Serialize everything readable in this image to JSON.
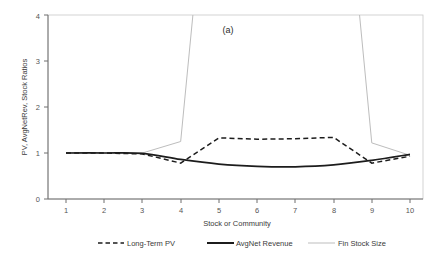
{
  "figure": {
    "panel_label": "(a)",
    "background": "#ffffff"
  },
  "axes": {
    "y_title": "PV, AvgNetRev, Stock Ratios",
    "x_title": "Stock or Community",
    "y_ticks": [
      "0",
      "1",
      "2",
      "3",
      "4"
    ],
    "x_ticks": [
      "1",
      "2",
      "3",
      "4",
      "5",
      "6",
      "7",
      "8",
      "9",
      "10"
    ]
  },
  "legend": {
    "items": [
      {
        "label": "Long-Term PV",
        "style": "dashed",
        "color": "#1c1c1c"
      },
      {
        "label": "AvgNet Revenue",
        "style": "solid-thick",
        "color": "#1c1c1c"
      },
      {
        "label": "Fin Stock Size",
        "style": "solid-thin",
        "color": "#bdbdbd"
      }
    ]
  },
  "chart_data": {
    "type": "line",
    "title": "(a)",
    "subtitle": "",
    "xlabel": "Stock or Community",
    "ylabel": "PV, AvgNetRev, Stock Ratios",
    "xlim": [
      1,
      10
    ],
    "ylim": [
      0,
      4
    ],
    "xticks": [
      1,
      2,
      3,
      4,
      5,
      6,
      7,
      8,
      9,
      10
    ],
    "yticks": [
      0,
      1,
      2,
      3,
      4
    ],
    "grid": false,
    "legend_position": "below-plot",
    "annotations": [
      {
        "text": "(a)",
        "x": 5.6,
        "y": 3.75
      },
      {
        "text": "Fin Stock Size exceeds the plotted y-range between x=4.3 and x=8.7",
        "x": 6.5,
        "y": 4.0
      }
    ],
    "x": [
      1,
      2,
      3,
      4,
      5,
      6,
      7,
      8,
      9,
      10
    ],
    "series": [
      {
        "name": "Long-Term PV",
        "color": "#1c1c1c",
        "style": "dashed",
        "values": [
          1.0,
          1.0,
          0.98,
          0.78,
          1.33,
          1.3,
          1.31,
          1.34,
          0.78,
          0.93
        ]
      },
      {
        "name": "AvgNet Revenue",
        "color": "#1c1c1c",
        "style": "solid",
        "values": [
          1.0,
          1.0,
          0.99,
          0.86,
          0.76,
          0.71,
          0.7,
          0.74,
          0.84,
          0.97
        ]
      },
      {
        "name": "Fin Stock Size",
        "color": "#bdbdbd",
        "style": "solid-thin",
        "values": [
          1.0,
          1.0,
          1.0,
          1.25,
          4.0,
          4.0,
          4.0,
          4.0,
          1.22,
          0.95
        ],
        "note": "Off-scale plateau above 4 between x=4.3 and x=8.7"
      }
    ]
  }
}
